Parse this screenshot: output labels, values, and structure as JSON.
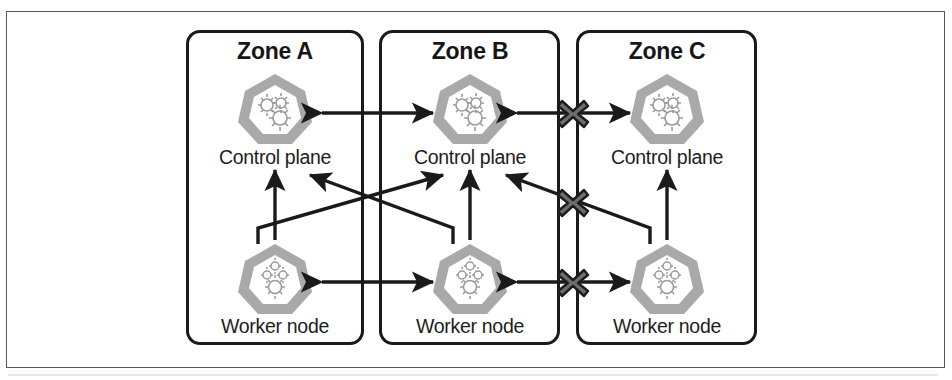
{
  "figure": {
    "width": 952,
    "height": 380,
    "background": "#ffffff",
    "frame_color": "#5a5a5a",
    "zone_border_color": "#1a1a1a",
    "arrow_color": "#1a1a1a",
    "icon_color": "#a8a8a8",
    "block_marker_color": "#2b2b2b"
  },
  "zones": [
    {
      "id": "zone-a",
      "title": "Zone A",
      "control_plane": {
        "label": "Control plane",
        "icon": "kubernetes-control-plane-icon"
      },
      "worker_node": {
        "label": "Worker node",
        "icon": "kubernetes-worker-node-icon"
      }
    },
    {
      "id": "zone-b",
      "title": "Zone B",
      "control_plane": {
        "label": "Control plane",
        "icon": "kubernetes-control-plane-icon"
      },
      "worker_node": {
        "label": "Worker node",
        "icon": "kubernetes-worker-node-icon"
      }
    },
    {
      "id": "zone-c",
      "title": "Zone C",
      "control_plane": {
        "label": "Control plane",
        "icon": "kubernetes-control-plane-icon"
      },
      "worker_node": {
        "label": "Worker node",
        "icon": "kubernetes-worker-node-icon"
      }
    }
  ],
  "connections": [
    {
      "id": "cp-a-to-cp-b",
      "from": "zone-a.control-plane",
      "to": "zone-b.control-plane",
      "style": "double-arrow",
      "blocked": false
    },
    {
      "id": "cp-b-to-cp-c",
      "from": "zone-b.control-plane",
      "to": "zone-c.control-plane",
      "style": "double-arrow",
      "blocked": true
    },
    {
      "id": "wn-a-to-wn-b",
      "from": "zone-a.worker-node",
      "to": "zone-b.worker-node",
      "style": "double-arrow",
      "blocked": false
    },
    {
      "id": "wn-b-to-wn-c",
      "from": "zone-b.worker-node",
      "to": "zone-c.worker-node",
      "style": "double-arrow",
      "blocked": true
    },
    {
      "id": "wn-a-to-cp-a",
      "from": "zone-a.worker-node",
      "to": "zone-a.control-plane",
      "style": "single-arrow",
      "blocked": false
    },
    {
      "id": "wn-b-to-cp-b",
      "from": "zone-b.worker-node",
      "to": "zone-b.control-plane",
      "style": "single-arrow",
      "blocked": false
    },
    {
      "id": "wn-c-to-cp-c",
      "from": "zone-c.worker-node",
      "to": "zone-c.control-plane",
      "style": "single-arrow",
      "blocked": false
    },
    {
      "id": "wn-a-to-cp-b",
      "from": "zone-a.worker-node",
      "to": "zone-b.control-plane",
      "style": "single-arrow-diagonal",
      "blocked": false
    },
    {
      "id": "wn-b-to-cp-a",
      "from": "zone-b.worker-node",
      "to": "zone-a.control-plane",
      "style": "single-arrow-diagonal",
      "blocked": false
    },
    {
      "id": "wn-c-to-cp-b",
      "from": "zone-c.worker-node",
      "to": "zone-b.control-plane",
      "style": "single-arrow-diagonal",
      "blocked": true
    }
  ],
  "block_markers": [
    {
      "id": "block-x-control-plane",
      "label": "x-block-icon"
    },
    {
      "id": "block-x-diagonal",
      "label": "x-block-icon"
    },
    {
      "id": "block-x-worker-node",
      "label": "x-block-icon"
    }
  ]
}
